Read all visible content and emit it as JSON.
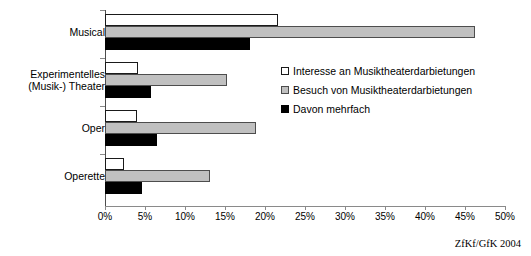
{
  "chart_data": {
    "type": "bar",
    "orientation": "horizontal",
    "title": "",
    "xlabel": "",
    "ylabel": "",
    "xlim": [
      0,
      50
    ],
    "xticks": [
      "0%",
      "5%",
      "10%",
      "15%",
      "20%",
      "25%",
      "30%",
      "35%",
      "40%",
      "45%",
      "50%"
    ],
    "xtick_values": [
      0,
      5,
      10,
      15,
      20,
      25,
      30,
      35,
      40,
      45,
      50
    ],
    "grid": false,
    "legend_position": "center-right",
    "categories": [
      "Musical",
      "Experimentelles\n(Musik-) Theater",
      "Oper",
      "Operette"
    ],
    "series": [
      {
        "name": "Interesse an Musiktheaterdarbietungen",
        "color": "#ffffff",
        "values": [
          21.6,
          4.1,
          4.0,
          2.4
        ]
      },
      {
        "name": "Besuch von Musiktheaterdarbietungen",
        "color": "#c0c0c0",
        "values": [
          46.3,
          15.2,
          18.9,
          13.1
        ]
      },
      {
        "name": "Davon mehrfach",
        "color": "#000000",
        "values": [
          18.1,
          5.8,
          6.5,
          4.6
        ]
      }
    ]
  },
  "credit": "ZfKf/GfK 2004"
}
